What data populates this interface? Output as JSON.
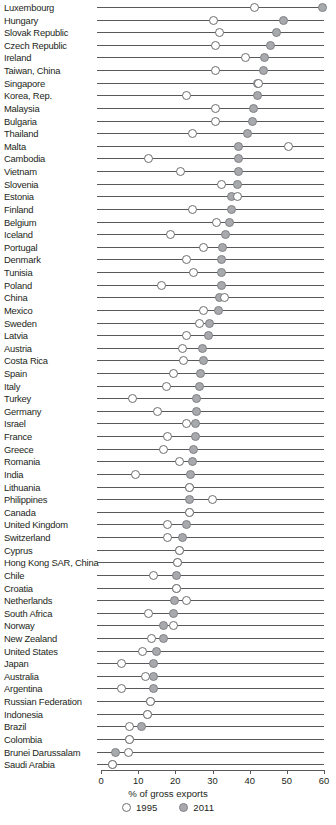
{
  "chart_data": {
    "type": "scatter",
    "variant": "dumbbell",
    "title": "",
    "xlabel": "% of gross exports",
    "ylabel": "",
    "xlim": [
      0,
      60
    ],
    "xticks": [
      0,
      10,
      20,
      30,
      40,
      50,
      60
    ],
    "grid": false,
    "legend": {
      "position": "bottom",
      "entries": [
        {
          "name": "1995",
          "marker": "open-circle",
          "color": "#ffffff",
          "edge": "#6d6e71"
        },
        {
          "name": "2011",
          "marker": "filled-circle",
          "color": "#a7a9ac",
          "edge": "#808285"
        }
      ]
    },
    "series": [
      {
        "name": "1995"
      },
      {
        "name": "2011"
      }
    ],
    "categories": [
      "Luxembourg",
      "Hungary",
      "Slovak Republic",
      "Czech Republic",
      "Ireland",
      "Taiwan, China",
      "Singapore",
      "Korea, Rep.",
      "Malaysia",
      "Bulgaria",
      "Thailand",
      "Malta",
      "Cambodia",
      "Vietnam",
      "Slovenia",
      "Estonia",
      "Finland",
      "Belgium",
      "Iceland",
      "Portugal",
      "Denmark",
      "Tunisia",
      "Poland",
      "China",
      "Mexico",
      "Sweden",
      "Latvia",
      "Austria",
      "Costa Rica",
      "Spain",
      "Italy",
      "Turkey",
      "Germany",
      "Israel",
      "France",
      "Greece",
      "Romania",
      "India",
      "Lithuania",
      "Philippines",
      "Canada",
      "United Kingdom",
      "Switzerland",
      "Cyprus",
      "Hong Kong SAR, China",
      "Chile",
      "Croatia",
      "Netherlands",
      "South Africa",
      "Norway",
      "New Zealand",
      "United States",
      "Japan",
      "Australia",
      "Argentina",
      "Russian Federation",
      "Indonesia",
      "Brazil",
      "Colombia",
      "Brunei Darussalam",
      "Saudi Arabia"
    ],
    "rows": [
      {
        "label": "Luxembourg",
        "v1995": 41.2,
        "v2011": 59.7
      },
      {
        "label": "Hungary",
        "v1995": 30.4,
        "v2011": 49.1
      },
      {
        "label": "Slovak Republic",
        "v1995": 32.0,
        "v2011": 47.1
      },
      {
        "label": "Czech Republic",
        "v1995": 30.9,
        "v2011": 45.7
      },
      {
        "label": "Ireland",
        "v1995": 39.0,
        "v2011": 44.1
      },
      {
        "label": "Taiwan, China",
        "v1995": 30.9,
        "v2011": 43.7
      },
      {
        "label": "Singapore",
        "v1995": 42.4,
        "v2011": 42.2
      },
      {
        "label": "Korea, Rep.",
        "v1995": 22.9,
        "v2011": 42.0
      },
      {
        "label": "Malaysia",
        "v1995": 30.9,
        "v2011": 40.9
      },
      {
        "label": "Bulgaria",
        "v1995": 30.7,
        "v2011": 40.7
      },
      {
        "label": "Thailand",
        "v1995": 24.5,
        "v2011": 39.5
      },
      {
        "label": "Malta",
        "v1995": 50.5,
        "v2011": 37.1
      },
      {
        "label": "Cambodia",
        "v1995": 12.9,
        "v2011": 37.1
      },
      {
        "label": "Vietnam",
        "v1995": 21.5,
        "v2011": 36.9
      },
      {
        "label": "Slovenia",
        "v1995": 32.5,
        "v2011": 36.6
      },
      {
        "label": "Estonia",
        "v1995": 36.6,
        "v2011": 35.2
      },
      {
        "label": "Finland",
        "v1995": 24.5,
        "v2011": 35.0
      },
      {
        "label": "Belgium",
        "v1995": 31.2,
        "v2011": 34.7
      },
      {
        "label": "Iceland",
        "v1995": 18.8,
        "v2011": 33.4
      },
      {
        "label": "Portugal",
        "v1995": 27.7,
        "v2011": 32.8
      },
      {
        "label": "Denmark",
        "v1995": 23.1,
        "v2011": 32.5
      },
      {
        "label": "Tunisia",
        "v1995": 25.0,
        "v2011": 32.3
      },
      {
        "label": "Poland",
        "v1995": 16.4,
        "v2011": 32.3
      },
      {
        "label": "China",
        "v1995": 33.3,
        "v2011": 32.0
      },
      {
        "label": "Mexico",
        "v1995": 27.7,
        "v2011": 31.5
      },
      {
        "label": "Sweden",
        "v1995": 26.4,
        "v2011": 29.3
      },
      {
        "label": "Latvia",
        "v1995": 23.1,
        "v2011": 28.8
      },
      {
        "label": "Austria",
        "v1995": 21.8,
        "v2011": 27.4
      },
      {
        "label": "Costa Rica",
        "v1995": 22.3,
        "v2011": 27.7
      },
      {
        "label": "Spain",
        "v1995": 19.4,
        "v2011": 26.9
      },
      {
        "label": "Italy",
        "v1995": 17.5,
        "v2011": 26.4
      },
      {
        "label": "Turkey",
        "v1995": 8.6,
        "v2011": 25.8
      },
      {
        "label": "Germany",
        "v1995": 15.1,
        "v2011": 25.8
      },
      {
        "label": "Israel",
        "v1995": 22.9,
        "v2011": 25.3
      },
      {
        "label": "France",
        "v1995": 17.8,
        "v2011": 25.3
      },
      {
        "label": "Greece",
        "v1995": 16.7,
        "v2011": 25.0
      },
      {
        "label": "Romania",
        "v1995": 21.0,
        "v2011": 24.5
      },
      {
        "label": "India",
        "v1995": 9.4,
        "v2011": 24.2
      },
      {
        "label": "Lithuania",
        "v1995": 23.9,
        "v2011": 23.9
      },
      {
        "label": "Philippines",
        "v1995": 30.1,
        "v2011": 23.7
      },
      {
        "label": "Canada",
        "v1995": 23.7,
        "v2011": 23.7
      },
      {
        "label": "United Kingdom",
        "v1995": 18.0,
        "v2011": 22.9
      },
      {
        "label": "Switzerland",
        "v1995": 17.8,
        "v2011": 22.0
      },
      {
        "label": "Cyprus",
        "v1995": 21.2,
        "v2011": 21.2
      },
      {
        "label": "Hong Kong SAR, China",
        "v1995": 20.7,
        "v2011": 20.7
      },
      {
        "label": "Chile",
        "v1995": 14.0,
        "v2011": 20.2
      },
      {
        "label": "Croatia",
        "v1995": 20.4,
        "v2011": 20.4
      },
      {
        "label": "Netherlands",
        "v1995": 23.1,
        "v2011": 19.9
      },
      {
        "label": "South Africa",
        "v1995": 12.9,
        "v2011": 19.6
      },
      {
        "label": "Norway",
        "v1995": 19.6,
        "v2011": 16.9
      },
      {
        "label": "New Zealand",
        "v1995": 13.7,
        "v2011": 16.7
      },
      {
        "label": "United States",
        "v1995": 11.3,
        "v2011": 14.8
      },
      {
        "label": "Japan",
        "v1995": 5.6,
        "v2011": 14.2
      },
      {
        "label": "Australia",
        "v1995": 12.1,
        "v2011": 14.0
      },
      {
        "label": "Argentina",
        "v1995": 5.6,
        "v2011": 14.0
      },
      {
        "label": "Russian Federation",
        "v1995": 13.4,
        "v2011": 13.4
      },
      {
        "label": "Indonesia",
        "v1995": 12.4,
        "v2011": 12.4
      },
      {
        "label": "Brazil",
        "v1995": 7.8,
        "v2011": 10.8
      },
      {
        "label": "Colombia",
        "v1995": 7.8,
        "v2011": 7.8
      },
      {
        "label": "Brunei Darussalam",
        "v1995": 7.3,
        "v2011": 4.0
      },
      {
        "label": "Saudi Arabia",
        "v1995": 3.2,
        "v2011": 3.2
      }
    ]
  },
  "axis": {
    "tick_labels": [
      "0",
      "10",
      "20",
      "30",
      "40",
      "50",
      "60"
    ],
    "title": "% of gross exports"
  },
  "legend": {
    "items": [
      {
        "label": "1995"
      },
      {
        "label": "2011"
      }
    ]
  },
  "footer": {
    "note": ""
  }
}
